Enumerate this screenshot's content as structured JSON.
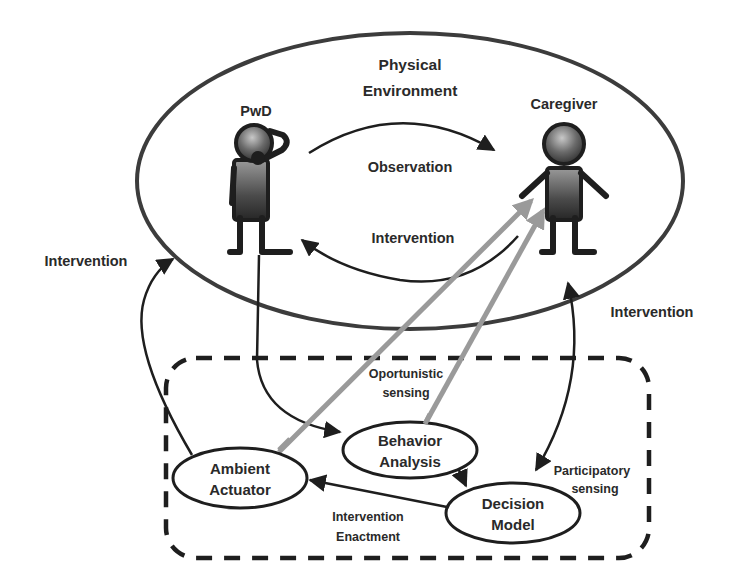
{
  "diagram": {
    "environment": {
      "label_line1": "Physical",
      "label_line2": "Environment"
    },
    "actors": {
      "pwd": {
        "label": "PwD"
      },
      "caregiver": {
        "label": "Caregiver"
      }
    },
    "edges": {
      "observation": "Observation",
      "intervention_inner": "Intervention",
      "intervention_left": "Intervention",
      "intervention_right": "Intervention",
      "opportunistic_line1": "Oportunistic",
      "opportunistic_line2": "sensing",
      "participatory_line1": "Participatory",
      "participatory_line2": "sensing",
      "enactment_line1": "Intervention",
      "enactment_line2": "Enactment"
    },
    "nodes": {
      "ambient_actuator": {
        "line1": "Ambient",
        "line2": "Actuator"
      },
      "behavior_analysis": {
        "line1": "Behavior",
        "line2": "Analysis"
      },
      "decision_model": {
        "line1": "Decision",
        "line2": "Model"
      }
    },
    "colors": {
      "stroke": "#1e1e1e",
      "ellipse_stroke": "#3c3c3c",
      "sensing_arrow": "#9a9a9a",
      "figure_fill_dark": "#2b2b2b",
      "figure_fill_light": "#8a8a8a"
    }
  }
}
